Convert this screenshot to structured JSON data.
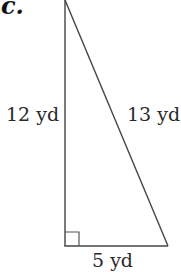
{
  "problem": {
    "part_label": "c.",
    "shape": "right triangle",
    "sides": {
      "vertical_leg": "12 yd",
      "hypotenuse": "13 yd",
      "horizontal_leg": "5 yd"
    },
    "right_angle_marker": "bottom-left"
  },
  "colors": {
    "stroke": "#444444",
    "background": "#ffffff"
  }
}
